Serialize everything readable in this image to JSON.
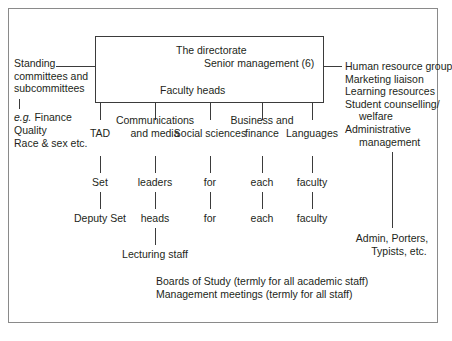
{
  "diagram": {
    "directorate_box": {
      "title": "The directorate",
      "senior_management": "Senior management (6)",
      "faculty_heads": "Faculty heads"
    },
    "left_panel": {
      "heading": "Standing committees and subcommittees",
      "examples_prefix": "e.g.",
      "examples": [
        "Finance",
        "Quality",
        "Race & sex etc."
      ]
    },
    "right_panel": {
      "items": [
        "Human resource group",
        "Marketing liaison",
        "Learning resources",
        "Student counselling/",
        "welfare",
        "Administrative",
        "management"
      ]
    },
    "columns": [
      {
        "label": "TAD",
        "row1": "Set",
        "row2": "Deputy Set"
      },
      {
        "label": "Communications and media",
        "row1": "leaders",
        "row2": "heads"
      },
      {
        "label": "Social sciences",
        "row1": "for",
        "row2": "for"
      },
      {
        "label": "Business and finance",
        "row1": "each",
        "row2": "each"
      },
      {
        "label": "Languages",
        "row1": "faculty",
        "row2": "faculty"
      }
    ],
    "lecturing_staff": "Lecturing staff",
    "footer_notes": [
      "Boards of Study (termly for all academic staff)",
      "Management meetings (termly for all staff)"
    ],
    "support_staff": [
      "Admin, Porters,",
      "Typists, etc."
    ]
  }
}
